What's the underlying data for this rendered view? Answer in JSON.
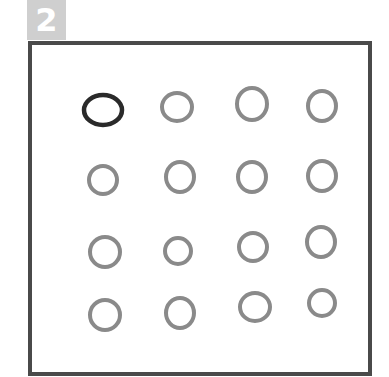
{
  "badge": {
    "label": "2",
    "color": "#cfcfcf"
  },
  "frame": {
    "border_color": "#4a4a4a"
  },
  "grid": {
    "rows": 4,
    "cols": 4,
    "highlight_color": "#2a2a2a",
    "default_color": "#8a8a8a",
    "circles": [
      {
        "row": 0,
        "col": 0,
        "cx": 103,
        "cy": 110,
        "rx": 19,
        "ry": 15,
        "highlighted": true
      },
      {
        "row": 0,
        "col": 1,
        "cx": 177,
        "cy": 107,
        "rx": 15,
        "ry": 14,
        "highlighted": false
      },
      {
        "row": 0,
        "col": 2,
        "cx": 252,
        "cy": 104,
        "rx": 15,
        "ry": 16,
        "highlighted": false
      },
      {
        "row": 0,
        "col": 3,
        "cx": 322,
        "cy": 106,
        "rx": 14,
        "ry": 15,
        "highlighted": false
      },
      {
        "row": 1,
        "col": 0,
        "cx": 103,
        "cy": 180,
        "rx": 14,
        "ry": 14,
        "highlighted": false
      },
      {
        "row": 1,
        "col": 1,
        "cx": 180,
        "cy": 177,
        "rx": 14,
        "ry": 15,
        "highlighted": false
      },
      {
        "row": 1,
        "col": 2,
        "cx": 252,
        "cy": 177,
        "rx": 14,
        "ry": 15,
        "highlighted": false
      },
      {
        "row": 1,
        "col": 3,
        "cx": 322,
        "cy": 176,
        "rx": 14,
        "ry": 15,
        "highlighted": false
      },
      {
        "row": 2,
        "col": 0,
        "cx": 105,
        "cy": 252,
        "rx": 15,
        "ry": 15,
        "highlighted": false
      },
      {
        "row": 2,
        "col": 1,
        "cx": 178,
        "cy": 251,
        "rx": 13,
        "ry": 13,
        "highlighted": false
      },
      {
        "row": 2,
        "col": 2,
        "cx": 253,
        "cy": 247,
        "rx": 14,
        "ry": 14,
        "highlighted": false
      },
      {
        "row": 2,
        "col": 3,
        "cx": 321,
        "cy": 242,
        "rx": 14,
        "ry": 15,
        "highlighted": false
      },
      {
        "row": 3,
        "col": 0,
        "cx": 105,
        "cy": 315,
        "rx": 15,
        "ry": 15,
        "highlighted": false
      },
      {
        "row": 3,
        "col": 1,
        "cx": 180,
        "cy": 313,
        "rx": 14,
        "ry": 15,
        "highlighted": false
      },
      {
        "row": 3,
        "col": 2,
        "cx": 255,
        "cy": 307,
        "rx": 15,
        "ry": 14,
        "highlighted": false
      },
      {
        "row": 3,
        "col": 3,
        "cx": 322,
        "cy": 303,
        "rx": 13,
        "ry": 13,
        "highlighted": false
      }
    ]
  }
}
